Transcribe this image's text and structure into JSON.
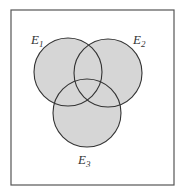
{
  "diagram": {
    "type": "venn",
    "frame": {
      "x": 11,
      "y": 10,
      "width": 163,
      "height": 175,
      "stroke": "#555555"
    },
    "fill_color": "#d6d6d6",
    "stroke_color": "#333333",
    "sets": [
      {
        "name": "E1",
        "base": "E",
        "sub": "1",
        "cx": 68,
        "cy": 72,
        "r": 34,
        "label_x": 31,
        "label_y": 44
      },
      {
        "name": "E2",
        "base": "E",
        "sub": "2",
        "cx": 108,
        "cy": 73,
        "r": 34,
        "label_x": 133,
        "label_y": 44
      },
      {
        "name": "E3",
        "base": "E",
        "sub": "3",
        "cx": 87,
        "cy": 113,
        "r": 34,
        "label_x": 78,
        "label_y": 164
      }
    ]
  }
}
